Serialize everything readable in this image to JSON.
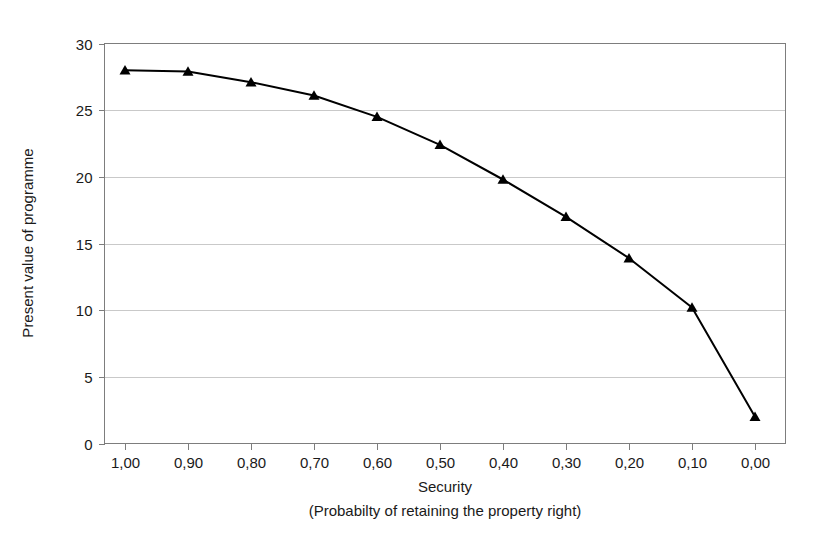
{
  "chart_data": {
    "type": "line",
    "title": "",
    "xlabel": "Security",
    "xlabel_sub": "(Probabilty of retaining the property right)",
    "ylabel": "Present value of programme",
    "categories": [
      "1,00",
      "0,90",
      "0,80",
      "0,70",
      "0,60",
      "0,50",
      "0,40",
      "0,30",
      "0,20",
      "0,10",
      "0,00"
    ],
    "x": [
      1.0,
      0.9,
      0.8,
      0.7,
      0.6,
      0.5,
      0.4,
      0.3,
      0.2,
      0.1,
      0.0
    ],
    "values": [
      28.0,
      27.9,
      27.1,
      26.1,
      24.5,
      22.4,
      19.8,
      17.0,
      13.9,
      10.2,
      2.0
    ],
    "series": [
      {
        "name": "Present value of programme",
        "values": [
          28.0,
          27.9,
          27.1,
          26.1,
          24.5,
          22.4,
          19.8,
          17.0,
          13.9,
          10.2,
          2.0
        ],
        "marker": "triangle",
        "color": "#000000"
      }
    ],
    "ylim": [
      0,
      30
    ],
    "yticks": [
      0,
      5,
      10,
      15,
      20,
      25,
      30
    ],
    "ytick_labels": [
      "0",
      "5",
      "10",
      "15",
      "20",
      "25",
      "30"
    ],
    "xtick_labels": [
      "1,00",
      "0,90",
      "0,80",
      "0,70",
      "0,60",
      "0,50",
      "0,40",
      "0,30",
      "0,20",
      "0,10",
      "0,00"
    ],
    "grid": true,
    "grid_axis": "y",
    "legend": false,
    "legend_position": "none",
    "colors": {
      "line": "#000000",
      "marker": "#000000",
      "grid": "#c9c9c9",
      "frame": "#7d7d7d",
      "background": "#ffffff",
      "text": "#1a1a1a"
    }
  }
}
